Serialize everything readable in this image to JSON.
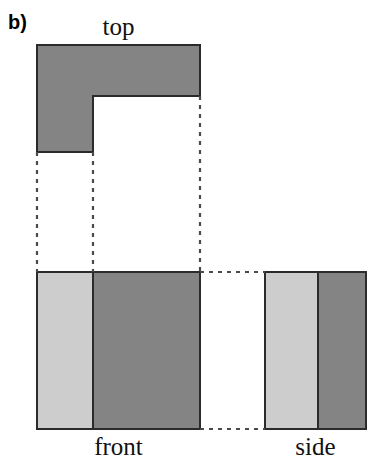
{
  "figure": {
    "panel_letter": "b)",
    "type": "orthographic-projection-drawing",
    "caption_labels": {
      "top": "top",
      "front": "front",
      "side": "side"
    },
    "colors": {
      "background": "#ffffff",
      "dark_gray_fill": "#848484",
      "light_gray_fill": "#cdcdcd",
      "outline": "#2b2b2b",
      "dashed_projection": "#4a4a4a",
      "text": "#111111"
    },
    "views": {
      "top_view": {
        "name": "top",
        "shape": "L-shape",
        "fill": "#848484",
        "outline_points": "37,45 200,45 200,96 93,96 93,152 37,152",
        "bounds": {
          "x": 37,
          "y": 45,
          "width": 163,
          "height": 107
        },
        "notch_inner_corner": {
          "x": 93,
          "y": 96
        }
      },
      "front_view": {
        "name": "front",
        "shape": "rectangle-split-vertically",
        "bounds": {
          "x": 37,
          "y": 272,
          "width": 163,
          "height": 157
        },
        "divider_x": 93,
        "left_region": {
          "fill": "#cdcdcd",
          "x": 37,
          "width": 56
        },
        "right_region": {
          "fill": "#848484",
          "x": 93,
          "width": 107
        }
      },
      "side_view": {
        "name": "side",
        "shape": "rectangle-split-vertically",
        "bounds": {
          "x": 265,
          "y": 272,
          "width": 101,
          "height": 157
        },
        "divider_x": 318,
        "left_region": {
          "fill": "#cdcdcd",
          "x": 265,
          "width": 53
        },
        "right_region": {
          "fill": "#848484",
          "x": 318,
          "width": 48
        }
      }
    },
    "projection_lines": {
      "vertical": [
        {
          "x": 37,
          "y1": 152,
          "y2": 272
        },
        {
          "x": 93,
          "y1": 152,
          "y2": 272
        },
        {
          "x": 200,
          "y1": 96,
          "y2": 272
        }
      ],
      "horizontal": [
        {
          "y": 272,
          "x1": 200,
          "x2": 265
        },
        {
          "y": 429,
          "x1": 200,
          "x2": 265
        }
      ]
    }
  }
}
